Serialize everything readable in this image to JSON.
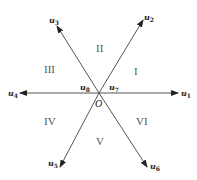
{
  "diagram": {
    "type": "space-vector-hexagon",
    "origin": {
      "label": "O",
      "x": 99,
      "y": 93
    },
    "colors": {
      "line": "#555555",
      "text": "#222222",
      "sector_text": "#555555"
    },
    "vectors": [
      {
        "id": "u1",
        "base": "u",
        "sub": "1",
        "tip": [
          178,
          93
        ],
        "label_pos": [
          182,
          96
        ]
      },
      {
        "id": "u2",
        "base": "u",
        "sub": "2",
        "tip": [
          143,
          20
        ],
        "label_pos": [
          143,
          20
        ]
      },
      {
        "id": "u3",
        "base": "u",
        "sub": "3",
        "tip": [
          57,
          26
        ],
        "label_pos": [
          49,
          24
        ]
      },
      {
        "id": "u4",
        "base": "u",
        "sub": "4",
        "tip": [
          20,
          93
        ],
        "label_pos": [
          8,
          96
        ]
      },
      {
        "id": "u5",
        "base": "u",
        "sub": "5",
        "tip": [
          60,
          167
        ],
        "label_pos": [
          48,
          167
        ]
      },
      {
        "id": "u6",
        "base": "u",
        "sub": "6",
        "tip": [
          147,
          167
        ],
        "label_pos": [
          150,
          170
        ]
      }
    ],
    "zero_vectors": [
      {
        "id": "u8",
        "base": "u",
        "sub": "8",
        "label_pos": [
          80,
          90
        ]
      },
      {
        "id": "u7",
        "base": "u",
        "sub": "7",
        "label_pos": [
          109,
          90
        ]
      }
    ],
    "sectors": [
      {
        "label": "I",
        "pos": [
          136,
          75
        ]
      },
      {
        "label": "II",
        "pos": [
          100,
          52
        ]
      },
      {
        "label": "III",
        "pos": [
          50,
          73
        ]
      },
      {
        "label": "IV",
        "pos": [
          50,
          125
        ]
      },
      {
        "label": "V",
        "pos": [
          100,
          145
        ]
      },
      {
        "label": "VI",
        "pos": [
          141,
          125
        ]
      }
    ]
  }
}
